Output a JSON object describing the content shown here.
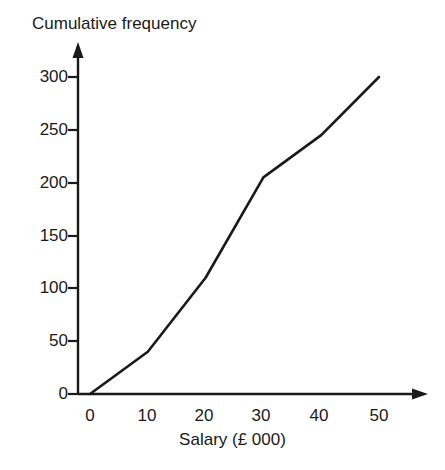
{
  "chart_data": {
    "type": "line",
    "title": "Cumulative frequency",
    "xlabel": "Salary (£ 000)",
    "ylabel": "Cumulative frequency",
    "x": [
      0,
      10,
      20,
      30,
      40,
      50
    ],
    "values": [
      0,
      40,
      110,
      205,
      245,
      300
    ],
    "series": [
      {
        "name": "Cumulative frequency",
        "values": [
          0,
          40,
          110,
          205,
          245,
          300
        ]
      }
    ],
    "xticks": [
      "0",
      "10",
      "20",
      "30",
      "40",
      "50"
    ],
    "yticks": [
      "0",
      "50",
      "100",
      "150",
      "200",
      "250",
      "300"
    ],
    "xlim": [
      0,
      50
    ],
    "ylim": [
      0,
      300
    ],
    "grid": false,
    "legend": false,
    "line_color": "#1a1a1a",
    "axis_color": "#1a1a1a",
    "background": "#ffffff"
  },
  "axes": {
    "y_title": "Cumulative frequency",
    "x_title": "Salary (£ 000)",
    "y_tick_labels": [
      "300",
      "250",
      "200",
      "150",
      "100",
      "50",
      "0"
    ],
    "x_tick_labels": [
      "0",
      "10",
      "20",
      "30",
      "40",
      "50"
    ]
  }
}
